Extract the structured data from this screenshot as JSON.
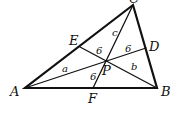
{
  "diagram": {
    "type": "triangle-cevians",
    "points": {
      "A": {
        "label": "A"
      },
      "B": {
        "label": "B"
      },
      "C": {
        "label": "C"
      },
      "D": {
        "label": "D"
      },
      "E": {
        "label": "E"
      },
      "F": {
        "label": "F"
      },
      "P": {
        "label": "P"
      }
    },
    "region_labels": {
      "a": "a",
      "b": "b",
      "c": "c",
      "area_EP": "6",
      "area_PD": "6",
      "area_PF": "6"
    },
    "colors": {
      "stroke": "#111111",
      "background": "#ffffff"
    }
  }
}
